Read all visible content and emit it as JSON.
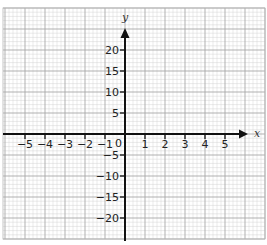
{
  "chart_data": {
    "type": "line",
    "title": "",
    "xlabel": "x",
    "ylabel": "y",
    "xlim": [
      -6,
      6
    ],
    "ylim": [
      -25,
      25
    ],
    "x_ticks": [
      -5,
      -4,
      -3,
      -2,
      -1,
      1,
      2,
      3,
      4,
      5
    ],
    "x_tick_labels": [
      "−5",
      "−4",
      "−3",
      "−2",
      "−1",
      "1",
      "2",
      "3",
      "4",
      "5"
    ],
    "y_ticks": [
      20,
      15,
      10,
      5,
      -5,
      -10,
      -15,
      -20
    ],
    "y_tick_labels": [
      "20",
      "15",
      "10",
      "5",
      "−5",
      "−10",
      "−15",
      "−20"
    ],
    "origin_label": "0",
    "grid": true,
    "grid_style": "graph paper, major lines every 1 x-unit and 5 y-units with 5 minor subdivisions",
    "series": [],
    "legend": null
  },
  "axes": {
    "x_name": "x",
    "y_name": "y",
    "origin": "0"
  },
  "colors": {
    "minor_grid": "#d4d4d4",
    "major_grid": "#a8a8a8",
    "axis": "#111111",
    "text": "#222222"
  }
}
